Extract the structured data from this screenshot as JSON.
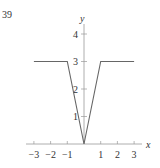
{
  "problem_number": "39",
  "chart_data": {
    "type": "line",
    "title": "",
    "xlabel": "x",
    "ylabel": "y",
    "xlim": [
      -3,
      3
    ],
    "ylim": [
      0,
      4
    ],
    "x_ticks": [
      -3,
      -2,
      -1,
      1,
      2,
      3
    ],
    "y_ticks": [
      1,
      2,
      3,
      4
    ],
    "x_tick_labels": [
      "−3",
      "−2",
      "−1",
      "1",
      "2",
      "3"
    ],
    "y_tick_labels": [
      "1",
      "2",
      "3",
      "4"
    ],
    "grid": false,
    "legend": null,
    "series": [
      {
        "name": "f(x)",
        "x": [
          -3,
          -1,
          0,
          1,
          3
        ],
        "y": [
          3,
          3,
          0,
          3,
          3
        ]
      }
    ],
    "colors": {
      "axis": "#999999",
      "curve": "#666666",
      "text": "#333333"
    }
  }
}
